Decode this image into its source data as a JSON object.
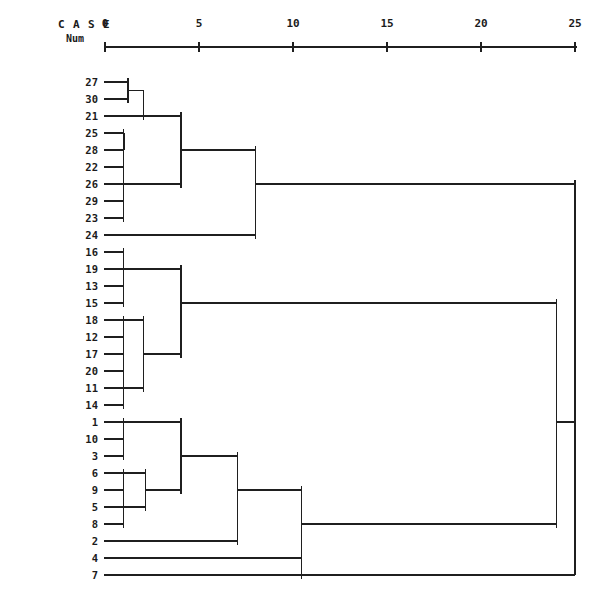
{
  "header": {
    "case_letters": [
      "C",
      "A",
      "S",
      "E"
    ],
    "num_label": "Num",
    "axis_tick_labels": [
      "0",
      "5",
      "10",
      "15",
      "20",
      "25"
    ]
  },
  "chart_data": {
    "type": "dendrogram",
    "title": "",
    "subtitle": "",
    "xlabel": "Rescaled Distance Cluster Combine",
    "ylabel": "CASE Num",
    "xlim": [
      0,
      26.2
    ],
    "axis_ticks": [
      0,
      5,
      10,
      15,
      20,
      25
    ],
    "grid": false,
    "legend": null,
    "leaf_order": [
      27,
      30,
      21,
      25,
      28,
      22,
      26,
      29,
      23,
      24,
      16,
      19,
      13,
      15,
      18,
      12,
      17,
      20,
      11,
      14,
      1,
      10,
      3,
      6,
      9,
      5,
      8,
      2,
      4,
      7
    ],
    "leaf_labels": [
      "27",
      "30",
      "21",
      "25",
      "28",
      "22",
      "26",
      "29",
      "23",
      "24",
      "16",
      "19",
      "13",
      "15",
      "18",
      "12",
      "17",
      "20",
      "11",
      "14",
      "1",
      "10",
      "3",
      "6",
      "9",
      "5",
      "8",
      "2",
      "4",
      "7"
    ],
    "merges": [
      {
        "id": "m1",
        "members": [
          27,
          30
        ],
        "distance": 1.0,
        "note": "27 + 30"
      },
      {
        "id": "m2",
        "members": [
          27,
          30,
          21
        ],
        "distance": 2.0,
        "note": "m1 + 21"
      },
      {
        "id": "m3",
        "members": [
          25,
          28
        ],
        "distance": 1.0,
        "note": "25 + 28"
      },
      {
        "id": "m4",
        "members": [
          25,
          28,
          22,
          26,
          29,
          23
        ],
        "distance": 1.0,
        "note": "chain 25-23 at col 1"
      },
      {
        "id": "m5",
        "members": [
          25,
          28,
          22,
          26,
          29,
          23,
          27,
          30,
          21
        ],
        "distance": 4.0,
        "note": "m2 + m4"
      },
      {
        "id": "m6",
        "members": [
          25,
          28,
          22,
          26,
          29,
          23,
          27,
          30,
          21,
          24
        ],
        "distance": 8.0,
        "note": "m5 + 24"
      },
      {
        "id": "m7",
        "members": [
          16,
          19,
          13,
          15
        ],
        "distance": 1.0,
        "note": "16,19,13,15 at col 1"
      },
      {
        "id": "m8",
        "members": [
          16,
          19,
          13,
          15,
          18,
          12,
          17,
          20,
          11,
          14
        ],
        "distance": 4.0,
        "note": "m7 + m9"
      },
      {
        "id": "m9",
        "members": [
          18,
          12,
          17,
          20,
          11,
          14
        ],
        "distance": 2.0,
        "note": "18-14 subgroup"
      },
      {
        "id": "m10",
        "members": [
          1,
          10,
          3
        ],
        "distance": 1.0,
        "note": "1,10,3 at col 1"
      },
      {
        "id": "m11",
        "members": [
          6,
          9,
          5,
          8
        ],
        "distance": 2.0,
        "note": "6,9,5,8 subgroup"
      },
      {
        "id": "m12",
        "members": [
          1,
          10,
          3,
          6,
          9,
          5,
          8
        ],
        "distance": 4.0,
        "note": "m10 + m11"
      },
      {
        "id": "m13",
        "members": [
          1,
          10,
          3,
          6,
          9,
          5,
          8,
          2
        ],
        "distance": 7.0,
        "note": "m12 + 2"
      },
      {
        "id": "m14",
        "members": [
          1,
          10,
          3,
          6,
          9,
          5,
          8,
          2,
          4
        ],
        "distance": 10.5,
        "note": "m13 + 4"
      },
      {
        "id": "m15",
        "members": [
          1,
          10,
          3,
          6,
          9,
          5,
          8,
          2,
          4,
          7
        ],
        "distance": 10.5,
        "note": "m14 + 7"
      },
      {
        "id": "m16",
        "members": "cluster1+cluster2",
        "distance": 25.0,
        "note": "cluster 1 root joins cluster 2 root"
      },
      {
        "id": "m17",
        "members": "all",
        "distance": 24.0,
        "note": "final root join with cluster 3"
      }
    ]
  },
  "geometry": {
    "x0_px": 105,
    "px_per_unit": 18.8,
    "leaf_top_px": 82,
    "leaf_step_px": 17.0,
    "stroke": "#1f1f1f",
    "axis_y_px": 47
  }
}
